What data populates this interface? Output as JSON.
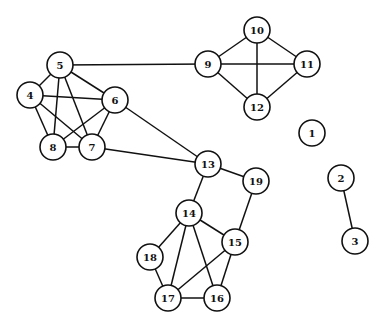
{
  "graph": {
    "nodes": [
      {
        "id": "1",
        "label": "1"
      },
      {
        "id": "2",
        "label": "2"
      },
      {
        "id": "3",
        "label": "3"
      },
      {
        "id": "4",
        "label": "4"
      },
      {
        "id": "5",
        "label": "5"
      },
      {
        "id": "6",
        "label": "6"
      },
      {
        "id": "7",
        "label": "7"
      },
      {
        "id": "8",
        "label": "8"
      },
      {
        "id": "9",
        "label": "9"
      },
      {
        "id": "10",
        "label": "10"
      },
      {
        "id": "11",
        "label": "11"
      },
      {
        "id": "12",
        "label": "12"
      },
      {
        "id": "13",
        "label": "13"
      },
      {
        "id": "14",
        "label": "14"
      },
      {
        "id": "15",
        "label": "15"
      },
      {
        "id": "16",
        "label": "16"
      },
      {
        "id": "17",
        "label": "17"
      },
      {
        "id": "18",
        "label": "18"
      },
      {
        "id": "19",
        "label": "19"
      }
    ],
    "edges": [
      [
        "5",
        "4"
      ],
      [
        "5",
        "6"
      ],
      [
        "5",
        "8"
      ],
      [
        "5",
        "7"
      ],
      [
        "4",
        "6"
      ],
      [
        "4",
        "8"
      ],
      [
        "4",
        "7"
      ],
      [
        "6",
        "8"
      ],
      [
        "6",
        "7"
      ],
      [
        "8",
        "7"
      ],
      [
        "5",
        "9"
      ],
      [
        "9",
        "10"
      ],
      [
        "10",
        "11"
      ],
      [
        "9",
        "11"
      ],
      [
        "10",
        "12"
      ],
      [
        "9",
        "12"
      ],
      [
        "11",
        "12"
      ],
      [
        "6",
        "13"
      ],
      [
        "7",
        "13"
      ],
      [
        "13",
        "14"
      ],
      [
        "13",
        "19"
      ],
      [
        "19",
        "15"
      ],
      [
        "14",
        "18"
      ],
      [
        "14",
        "17"
      ],
      [
        "14",
        "16"
      ],
      [
        "14",
        "15"
      ],
      [
        "15",
        "17"
      ],
      [
        "15",
        "16"
      ],
      [
        "18",
        "17"
      ],
      [
        "17",
        "16"
      ],
      [
        "2",
        "3"
      ]
    ]
  }
}
